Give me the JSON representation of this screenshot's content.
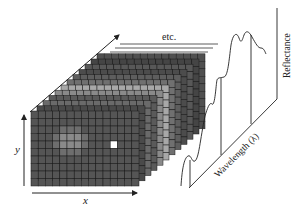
{
  "diagram": {
    "labels": {
      "x_axis": "x",
      "y_axis": "y",
      "more_bands": "etc.",
      "wavelength_axis": "Wavelength (λ)",
      "reflectance_axis": "Reflectance"
    },
    "cube": {
      "grid_columns": 15,
      "grid_rows": 10,
      "band_layers": 12,
      "highlighted_pixel": {
        "column": 11,
        "row": 4,
        "color": "#ffffff"
      },
      "layer_colors": [
        "#555555",
        "#4a4a4a",
        "#6a6a6a",
        "#5a5a5a",
        "#8a8a8a",
        "#a8a8a8",
        "#707070",
        "#5e5e5e",
        "#4c4c4c",
        "#585858",
        "#454545",
        "#505050"
      ]
    },
    "spectrum": {
      "type": "line",
      "description": "Reflectance spectrum of the highlighted pixel across wavelength bands",
      "drop_lines_at": [
        0.08,
        0.55,
        0.78
      ]
    },
    "colors": {
      "grid_line": "#1a1a1a",
      "cell": "#555555",
      "axis": "#222222"
    }
  }
}
